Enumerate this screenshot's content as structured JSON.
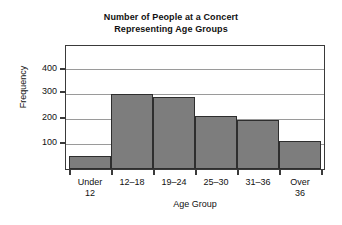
{
  "chart_data": {
    "type": "bar",
    "title": "Number of People at a Concert Representing Age Groups",
    "title_lines": [
      "Number of People at a Concert",
      "Representing Age Groups"
    ],
    "categories": [
      "Under 12",
      "12–18",
      "19–24",
      "25–30",
      "31–36",
      "Over 36"
    ],
    "category_lines": [
      [
        "Under",
        "12"
      ],
      [
        "12–18",
        ""
      ],
      [
        "19–24",
        ""
      ],
      [
        "25–30",
        ""
      ],
      [
        "31–36",
        ""
      ],
      [
        "Over",
        "36"
      ]
    ],
    "values": [
      50,
      300,
      285,
      210,
      195,
      110
    ],
    "xlabel": "Age Group",
    "ylabel": "Frequency",
    "ylim": [
      0,
      490
    ],
    "yticks": [
      100,
      200,
      300,
      400
    ],
    "ytick_labels": [
      "100",
      "200",
      "300",
      "400"
    ],
    "grid": true,
    "legend": false,
    "bar_color": "#7d7d7d",
    "bar_edge_color": "#2e2e2e",
    "grid_color": "#9a9a9a",
    "axis_color": "#3a3a3a",
    "background": "#ffffff"
  }
}
